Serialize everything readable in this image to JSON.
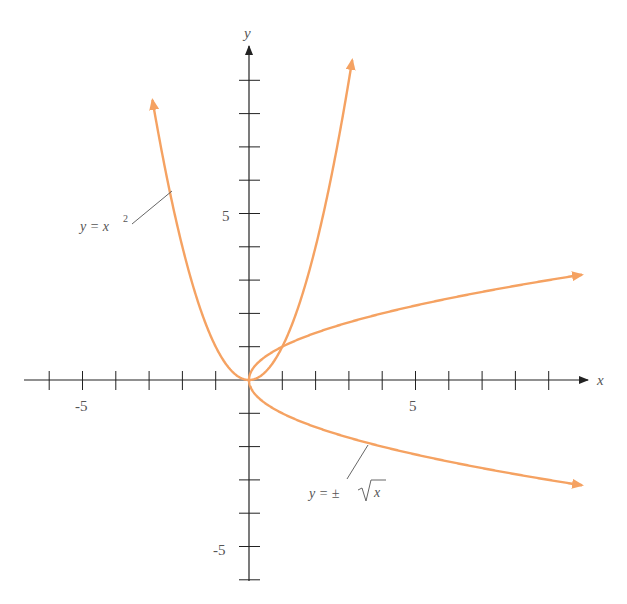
{
  "chart_data": {
    "type": "line",
    "title": "",
    "xlabel": "x",
    "ylabel": "y",
    "x_ticks": [
      -6,
      -5,
      -4,
      -3,
      -2,
      -1,
      1,
      2,
      3,
      4,
      5,
      6,
      7,
      8,
      9
    ],
    "y_ticks": [
      -6,
      -5,
      -4,
      -3,
      -2,
      -1,
      1,
      2,
      3,
      4,
      5,
      6,
      7,
      8,
      9
    ],
    "x_tick_labels": {
      "-5": "-5",
      "5": "5"
    },
    "y_tick_labels": {
      "5": "5",
      "-5": "-5"
    },
    "xlim": [
      -6.5,
      10.5
    ],
    "ylim": [
      -6,
      10
    ],
    "grid": false,
    "legend": "none",
    "series": [
      {
        "name": "y = x^2",
        "label_text": "y = x",
        "label_sup": "2",
        "x_range": [
          -2.9,
          3.1
        ],
        "color": "#f5a262"
      },
      {
        "name": "y = ± √x",
        "label_text": "y = ±",
        "label_radical": "x",
        "x_range": [
          0,
          10
        ],
        "branches": [
          "+",
          "-"
        ],
        "color": "#f5a262"
      }
    ],
    "annotations": [
      {
        "text": "y = x²",
        "points_to": [
          -2.3,
          5.3
        ]
      },
      {
        "text": "y = ± √x",
        "points_to": [
          4,
          -2
        ]
      }
    ]
  },
  "axes": {
    "x_label": "x",
    "y_label": "y",
    "tick_5": "5",
    "tick_neg5": "-5"
  },
  "colors": {
    "curve": "#f5a262",
    "axis": "#222222",
    "text": "#555555"
  }
}
